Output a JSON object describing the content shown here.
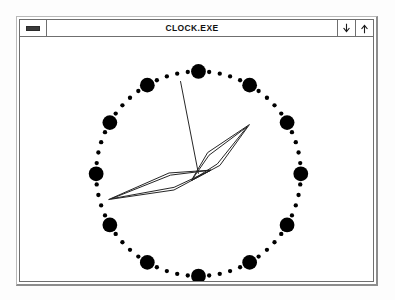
{
  "window": {
    "title": "CLOCK.EXE",
    "sysmenu_label": "System Menu",
    "minimize_label": "Minimize",
    "maximize_label": "Maximize",
    "minimize_icon": "down-arrow-icon",
    "maximize_icon": "up-arrow-icon",
    "sysmenu_icon": "window-menu-bar-icon"
  },
  "clock": {
    "face_label": "Analog Clock Face",
    "style": "analog",
    "center_x": 199,
    "center_y": 137,
    "hour_dot_radius": 104,
    "hour_dot_size": 7.5,
    "minute_dot_size": 2.2,
    "hour_marks": 12,
    "minute_marks_between": 4,
    "dot_color": "#000000",
    "hand_color": "#222222",
    "hands": {
      "hour": {
        "label": "hour-hand",
        "tip_x": 252,
        "tip_y": 85,
        "length": 72,
        "width": 9,
        "angle_deg": 46
      },
      "minute": {
        "label": "minute-hand",
        "tip_x": 108,
        "tip_y": 163,
        "length": 95,
        "width": 9,
        "angle_deg": 254
      },
      "second": {
        "label": "second-hand",
        "tip_x": 180,
        "tip_y": 42,
        "length": 96,
        "angle_deg": 349
      }
    }
  }
}
